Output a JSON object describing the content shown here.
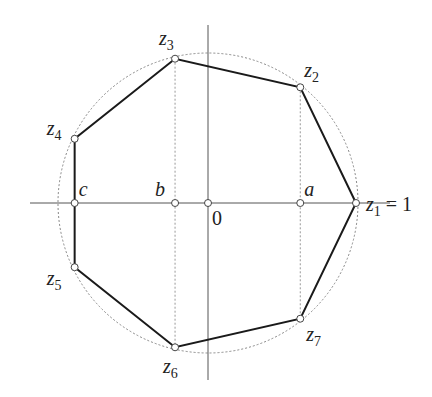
{
  "diagram": {
    "colors": {
      "polygon": "#1a1a1a",
      "axes": "#555555",
      "circle": "#888888",
      "projection": "#999999",
      "vertex_fill": "#ffffff",
      "vertex_stroke": "#444444"
    },
    "n_vertices": 7,
    "vertices": [
      {
        "id": "z1",
        "name": "z",
        "sub": "1",
        "suffix": " = 1",
        "angle_deg": 0
      },
      {
        "id": "z2",
        "name": "z",
        "sub": "2",
        "suffix": "",
        "angle_deg": 51.43
      },
      {
        "id": "z3",
        "name": "z",
        "sub": "3",
        "suffix": "",
        "angle_deg": 102.86
      },
      {
        "id": "z4",
        "name": "z",
        "sub": "4",
        "suffix": "",
        "angle_deg": 154.29
      },
      {
        "id": "z5",
        "name": "z",
        "sub": "5",
        "suffix": "",
        "angle_deg": 205.71
      },
      {
        "id": "z6",
        "name": "z",
        "sub": "6",
        "suffix": "",
        "angle_deg": 257.14
      },
      {
        "id": "z7",
        "name": "z",
        "sub": "7",
        "suffix": "",
        "angle_deg": 308.57
      }
    ],
    "axis_points": [
      {
        "id": "a",
        "label": "a",
        "value": 0.6235
      },
      {
        "id": "b",
        "label": "b",
        "value": -0.2225
      },
      {
        "id": "c",
        "label": "c",
        "value": -0.901
      },
      {
        "id": "origin",
        "label": "0",
        "value": 0
      }
    ]
  }
}
